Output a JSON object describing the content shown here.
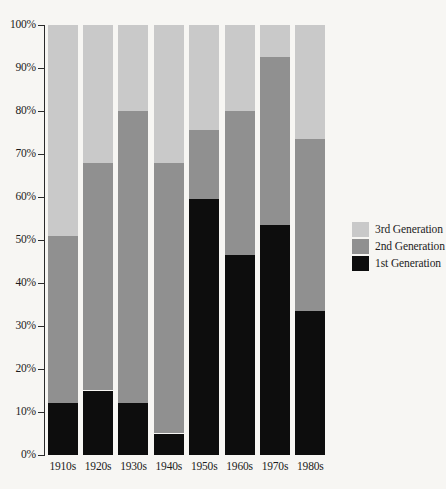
{
  "chart_data": {
    "type": "bar",
    "stacked": true,
    "stack_mode": "percent",
    "title": "",
    "subtitle": "",
    "xlabel": "",
    "ylabel": "",
    "grid": false,
    "ylim": [
      0,
      100
    ],
    "legend_position": "right",
    "categories": [
      "1910s",
      "1920s",
      "1930s",
      "1940s",
      "1950s",
      "1960s",
      "1970s",
      "1980s"
    ],
    "ytick_labels": [
      "100%",
      "90%",
      "80%",
      "70%",
      "60%",
      "50%",
      "40%",
      "30%",
      "20%",
      "10%",
      "0%"
    ],
    "ytick_values": [
      100,
      90,
      80,
      70,
      60,
      50,
      40,
      30,
      20,
      10,
      0
    ],
    "series": [
      {
        "name": "1st Generation",
        "color": "#0d0d0d",
        "values": [
          12,
          15,
          12,
          5,
          59.5,
          46.5,
          53.5,
          33.5
        ]
      },
      {
        "name": "2nd Generation",
        "color": "#909090",
        "values": [
          39,
          53,
          68,
          63,
          16,
          33.5,
          39,
          40
        ]
      },
      {
        "name": "3rd Generation",
        "color": "#c9c9c9",
        "values": [
          49,
          32,
          20,
          32,
          24.5,
          20,
          7.5,
          26.5
        ]
      }
    ],
    "cumulative_tops": {
      "gen1": [
        12,
        15,
        12,
        5,
        59.5,
        46.5,
        53.5,
        33.5
      ],
      "gen1_plus_gen2": [
        51,
        68,
        80,
        68,
        75.5,
        80,
        92.5,
        73.5
      ],
      "total": [
        100,
        100,
        100,
        100,
        100,
        100,
        100,
        100
      ]
    }
  },
  "legend": {
    "entries": [
      {
        "label": "3rd Generation",
        "color": "#c9c9c9",
        "key": "gen3"
      },
      {
        "label": "2nd Generation",
        "color": "#909090",
        "key": "gen2"
      },
      {
        "label": "1st Generation",
        "color": "#0d0d0d",
        "key": "gen1"
      }
    ]
  },
  "colors": {
    "background": "#f7f6f3",
    "axis": "#2a2a2a",
    "text": "#1c1c1c",
    "gen1": "#0d0d0d",
    "gen2": "#909090",
    "gen3": "#c9c9c9"
  }
}
